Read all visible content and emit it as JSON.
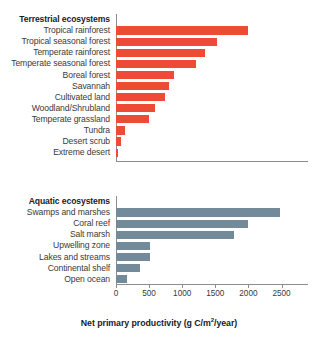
{
  "chart_data": {
    "type": "bar",
    "orientation": "horizontal",
    "title": "",
    "xlabel": "Net primary productivity (g C/m2/year)",
    "ylabel": "",
    "xlim": [
      0,
      2900
    ],
    "grid": false,
    "legend": "none",
    "xticks": [
      0,
      500,
      1000,
      1500,
      2000,
      2500
    ],
    "xtick_labels": [
      "0",
      "500",
      "1000",
      "1500",
      "2000",
      "2500"
    ],
    "panels": [
      {
        "group_label": "Terrestrial ecosystems",
        "color": "#ee4b36",
        "categories": [
          "Tropical rainforest",
          "Tropical seasonal forest",
          "Temperate rainforest",
          "Temperate seasonal forest",
          "Boreal forest",
          "Savannah",
          "Cultivated land",
          "Woodland/Shrubland",
          "Temperate grassland",
          "Tundra",
          "Desert scrub",
          "Extreme desert"
        ],
        "values": [
          2000,
          1520,
          1340,
          1210,
          875,
          800,
          740,
          585,
          505,
          140,
          70,
          30
        ]
      },
      {
        "group_label": "Aquatic ecosystems",
        "color": "#738a9b",
        "categories": [
          "Swamps and marshes",
          "Coral reef",
          "Salt marsh",
          "Upwelling zone",
          "Lakes and streams",
          "Continental shelf",
          "Open ocean"
        ],
        "values": [
          2470,
          2000,
          1780,
          520,
          520,
          370,
          160
        ]
      }
    ]
  },
  "axis": {
    "title_main": "Net primary productivity (g C/m",
    "title_sup": "2",
    "title_tail": "/year)"
  }
}
